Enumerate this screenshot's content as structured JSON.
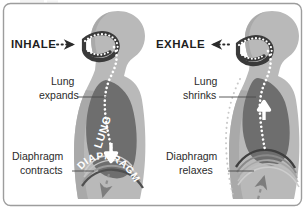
{
  "figure": {
    "type": "anatomical-diagram",
    "border_color": "#a8a8a8",
    "background_color": "#ffffff",
    "cropped_caption_top": "",
    "panels": [
      {
        "id": "inhale",
        "title": "INHALE",
        "title_arrow": "arrow-right",
        "title_leader": "dotted",
        "callouts": [
          {
            "id": "lung-expands",
            "line1": "Lung",
            "line2": "expands"
          },
          {
            "id": "diaphragm-contracts",
            "line1": "Diaphragm",
            "line2": "contracts"
          }
        ],
        "organ_labels": [
          {
            "id": "lung",
            "text": "LUNG"
          },
          {
            "id": "diaphragm",
            "text": "DIAPHRAGM"
          }
        ],
        "flow_arrow_direction": "down",
        "diaphragm_arrow_direction": "down"
      },
      {
        "id": "exhale",
        "title": "EXHALE",
        "title_arrow": "arrow-left",
        "title_leader": "dotted",
        "callouts": [
          {
            "id": "lung-shrinks",
            "line1": "Lung",
            "line2": "shrinks"
          },
          {
            "id": "diaphragm-relaxes",
            "line1": "Diaphragm",
            "line2": "relaxes"
          }
        ],
        "organ_labels": [],
        "flow_arrow_direction": "up",
        "diaphragm_arrow_direction": "up"
      }
    ]
  },
  "colors": {
    "body_silhouette": "#b9b9b9",
    "body_shadow": "#a3a3a3",
    "lung_fill": "#6e6e6e",
    "airway_dots": "#ffffff",
    "airway_outline": "#3a3a3a",
    "text_dark": "#2b2b2b",
    "leader_line": "#4a4a4a",
    "flow_arrow": "#ffffff",
    "diaphragm_arrow": "#7d7d7d",
    "border": "#9d9d9d"
  }
}
